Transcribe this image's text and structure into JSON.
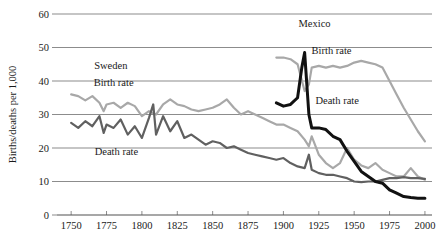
{
  "chart_data": {
    "type": "line",
    "title": "",
    "xlabel": "",
    "ylabel": "Births/deaths per 1,000",
    "xlim": [
      1740,
      2005
    ],
    "ylim": [
      0,
      60
    ],
    "xticks": [
      1750,
      1775,
      1800,
      1825,
      1850,
      1875,
      1900,
      1925,
      1950,
      1975,
      2000
    ],
    "yticks": [
      0,
      10,
      20,
      30,
      40,
      50,
      60
    ],
    "grid": "horizontal",
    "legend": "inline-annotations",
    "annotations": [
      {
        "text": "Sweden",
        "x": 1778,
        "y": 43.5
      },
      {
        "text": "Birth rate",
        "x": 1780,
        "y": 38.5
      },
      {
        "text": "Death rate",
        "x": 1782,
        "y": 18.0
      },
      {
        "text": "Mexico",
        "x": 1922,
        "y": 56.0
      },
      {
        "text": "Birth rate",
        "x": 1934,
        "y": 48.0
      },
      {
        "text": "Death rate",
        "x": 1938,
        "y": 33.0
      }
    ],
    "series": [
      {
        "name": "Sweden birth rate",
        "color": "#a8a8a8",
        "x": [
          1750,
          1755,
          1760,
          1765,
          1770,
          1773,
          1775,
          1780,
          1785,
          1790,
          1795,
          1800,
          1805,
          1810,
          1815,
          1820,
          1825,
          1830,
          1835,
          1840,
          1845,
          1850,
          1855,
          1860,
          1865,
          1870,
          1875,
          1880,
          1885,
          1890,
          1895,
          1900,
          1905,
          1910,
          1915,
          1918,
          1920,
          1925,
          1930,
          1935,
          1940,
          1945,
          1950,
          1955,
          1960,
          1965,
          1970,
          1975,
          1980,
          1985,
          1990,
          1995,
          2000
        ],
        "y": [
          36.0,
          35.5,
          34.2,
          35.5,
          33.5,
          31.0,
          33.0,
          33.5,
          32.0,
          33.5,
          32.5,
          29.5,
          31.0,
          30.0,
          33.0,
          34.5,
          33.0,
          32.5,
          31.5,
          31.0,
          31.5,
          32.0,
          33.0,
          34.5,
          32.0,
          30.0,
          31.0,
          30.0,
          29.0,
          28.0,
          27.0,
          27.0,
          26.0,
          25.0,
          22.5,
          20.5,
          23.5,
          18.0,
          15.5,
          14.0,
          15.5,
          20.0,
          16.5,
          14.8,
          14.0,
          15.5,
          13.5,
          12.5,
          11.5,
          11.5,
          14.0,
          11.5,
          10.5
        ]
      },
      {
        "name": "Sweden death rate",
        "color": "#606060",
        "x": [
          1750,
          1755,
          1760,
          1765,
          1770,
          1773,
          1775,
          1780,
          1785,
          1790,
          1795,
          1800,
          1805,
          1808,
          1810,
          1815,
          1820,
          1825,
          1830,
          1835,
          1840,
          1845,
          1850,
          1855,
          1860,
          1865,
          1870,
          1875,
          1880,
          1885,
          1890,
          1895,
          1900,
          1905,
          1910,
          1915,
          1918,
          1920,
          1925,
          1930,
          1935,
          1940,
          1945,
          1950,
          1955,
          1960,
          1965,
          1970,
          1975,
          1980,
          1985,
          1990,
          1995,
          2000
        ],
        "y": [
          27.5,
          26.0,
          28.0,
          26.5,
          29.5,
          24.5,
          27.0,
          26.0,
          28.5,
          24.0,
          26.5,
          23.0,
          29.0,
          33.0,
          24.0,
          29.5,
          25.0,
          28.0,
          23.0,
          24.0,
          22.5,
          21.0,
          22.0,
          21.5,
          20.0,
          20.5,
          19.5,
          18.5,
          18.0,
          17.5,
          17.0,
          16.5,
          17.0,
          15.5,
          14.5,
          14.0,
          18.0,
          13.5,
          12.5,
          12.0,
          12.0,
          11.5,
          11.0,
          10.0,
          9.8,
          10.0,
          10.0,
          10.5,
          11.0,
          11.0,
          11.3,
          11.0,
          11.0,
          10.8
        ]
      },
      {
        "name": "Mexico birth rate",
        "color": "#a8a8a8",
        "x": [
          1895,
          1900,
          1905,
          1910,
          1915,
          1918,
          1920,
          1925,
          1930,
          1935,
          1940,
          1945,
          1950,
          1955,
          1960,
          1965,
          1970,
          1975,
          1980,
          1985,
          1990,
          1995,
          2000
        ],
        "y": [
          47.0,
          47.0,
          46.5,
          45.0,
          37.0,
          39.0,
          44.0,
          44.5,
          44.0,
          44.5,
          44.0,
          44.5,
          45.5,
          46.0,
          45.5,
          45.0,
          44.0,
          40.0,
          36.0,
          32.0,
          28.5,
          25.0,
          22.0
        ]
      },
      {
        "name": "Mexico death rate",
        "color": "#111111",
        "x": [
          1895,
          1900,
          1905,
          1910,
          1913,
          1915,
          1918,
          1920,
          1925,
          1930,
          1935,
          1940,
          1945,
          1950,
          1955,
          1960,
          1965,
          1970,
          1975,
          1980,
          1985,
          1990,
          1995,
          2000
        ],
        "y": [
          33.5,
          32.5,
          33.0,
          35.0,
          44.0,
          48.5,
          30.0,
          26.0,
          26.0,
          25.5,
          23.5,
          22.5,
          19.0,
          16.0,
          13.0,
          11.5,
          10.0,
          9.5,
          7.5,
          6.5,
          5.5,
          5.2,
          5.0,
          5.0
        ]
      }
    ]
  }
}
